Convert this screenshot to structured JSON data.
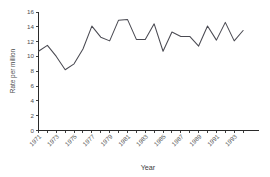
{
  "chart_data": {
    "type": "line",
    "title": "",
    "xlabel": "Year",
    "ylabel": "Rate per million",
    "xlim": [
      1971,
      1995
    ],
    "ylim": [
      0,
      16
    ],
    "ytick_values": [
      0,
      2,
      4,
      6,
      8,
      10,
      12,
      14,
      16
    ],
    "ytick_labels": [
      "0",
      "2",
      "4",
      "6",
      "8",
      "10",
      "12",
      "14",
      "16"
    ],
    "xtick_labels": [
      "1971",
      "1973",
      "1975",
      "1977",
      "1979",
      "1981",
      "1983",
      "1985",
      "1987",
      "1989",
      "1991",
      "1993"
    ],
    "xtick_label_years": [
      1971,
      1973,
      1975,
      1977,
      1979,
      1981,
      1983,
      1985,
      1987,
      1989,
      1991,
      1993
    ],
    "x": [
      1971,
      1972,
      1973,
      1974,
      1975,
      1976,
      1977,
      1978,
      1979,
      1980,
      1981,
      1982,
      1983,
      1984,
      1985,
      1986,
      1987,
      1988,
      1989,
      1990,
      1991,
      1992,
      1993,
      1994
    ],
    "values": [
      10.7,
      11.5,
      10.0,
      8.2,
      9.0,
      11.0,
      14.1,
      12.6,
      12.1,
      14.9,
      15.0,
      12.3,
      12.3,
      14.4,
      10.7,
      13.3,
      12.7,
      12.7,
      11.4,
      14.1,
      12.2,
      14.6,
      12.1,
      13.5
    ],
    "series": [
      {
        "name": "Rate per million",
        "values": [
          10.7,
          11.5,
          10.0,
          8.2,
          9.0,
          11.0,
          14.1,
          12.6,
          12.1,
          14.9,
          15.0,
          12.3,
          12.3,
          14.4,
          10.7,
          13.3,
          12.7,
          12.7,
          11.4,
          14.1,
          12.2,
          14.6,
          12.1,
          13.5
        ]
      }
    ],
    "line_color": "#4a4a52",
    "axis_color": "#2a2a2a",
    "grid": false,
    "legend": false,
    "legend_position": "none",
    "xtick_label_rotation": 45
  }
}
